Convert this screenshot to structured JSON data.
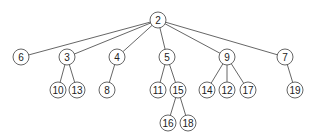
{
  "diagram": {
    "type": "tree",
    "root": "2",
    "nodes": [
      {
        "id": "2",
        "label": "2",
        "x": 158,
        "y": 20
      },
      {
        "id": "6",
        "label": "6",
        "x": 21,
        "y": 57
      },
      {
        "id": "3",
        "label": "3",
        "x": 67,
        "y": 57
      },
      {
        "id": "4",
        "label": "4",
        "x": 117,
        "y": 57
      },
      {
        "id": "5",
        "label": "5",
        "x": 167,
        "y": 57
      },
      {
        "id": "9",
        "label": "9",
        "x": 227,
        "y": 57
      },
      {
        "id": "7",
        "label": "7",
        "x": 285,
        "y": 57
      },
      {
        "id": "10",
        "label": "10",
        "x": 58,
        "y": 90
      },
      {
        "id": "13",
        "label": "13",
        "x": 77,
        "y": 90
      },
      {
        "id": "8",
        "label": "8",
        "x": 107,
        "y": 90
      },
      {
        "id": "11",
        "label": "11",
        "x": 158,
        "y": 90
      },
      {
        "id": "15",
        "label": "15",
        "x": 178,
        "y": 90
      },
      {
        "id": "14",
        "label": "14",
        "x": 207,
        "y": 90
      },
      {
        "id": "12",
        "label": "12",
        "x": 227,
        "y": 90
      },
      {
        "id": "17",
        "label": "17",
        "x": 248,
        "y": 90
      },
      {
        "id": "19",
        "label": "19",
        "x": 295,
        "y": 90
      },
      {
        "id": "16",
        "label": "16",
        "x": 168,
        "y": 123
      },
      {
        "id": "18",
        "label": "18",
        "x": 188,
        "y": 123
      }
    ],
    "edges": [
      [
        "2",
        "6"
      ],
      [
        "2",
        "3"
      ],
      [
        "2",
        "4"
      ],
      [
        "2",
        "5"
      ],
      [
        "2",
        "9"
      ],
      [
        "2",
        "7"
      ],
      [
        "3",
        "10"
      ],
      [
        "3",
        "13"
      ],
      [
        "4",
        "8"
      ],
      [
        "5",
        "11"
      ],
      [
        "5",
        "15"
      ],
      [
        "9",
        "14"
      ],
      [
        "9",
        "12"
      ],
      [
        "9",
        "17"
      ],
      [
        "7",
        "19"
      ],
      [
        "15",
        "16"
      ],
      [
        "15",
        "18"
      ]
    ],
    "node_radius": 8
  }
}
